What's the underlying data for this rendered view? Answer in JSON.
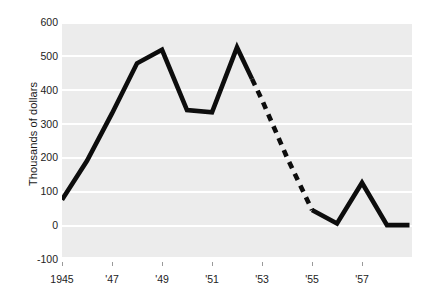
{
  "axes": {
    "ylabel": "Thousands of dollars",
    "yticks": [
      600,
      500,
      400,
      300,
      200,
      100,
      0,
      -100
    ],
    "ytick_labels": [
      "600",
      "500",
      "400",
      "300",
      "200",
      "100",
      "0",
      "-100"
    ],
    "xtick_labels": [
      "1945",
      "'47",
      "'49",
      "'51",
      "'53",
      "'55",
      "'57"
    ],
    "xtick_years": [
      1945,
      1947,
      1949,
      1951,
      1953,
      1955,
      1957
    ]
  },
  "style": {
    "plot_background": "#ececec",
    "gridline_color": "#ffffff",
    "line_color": "#0d0d0d",
    "text_color": "#222222"
  },
  "chart_data": {
    "type": "line",
    "title": "",
    "xlabel": "",
    "ylabel": "Thousands of dollars",
    "xlim": [
      1945,
      1959
    ],
    "ylim": [
      -100,
      600
    ],
    "grid": true,
    "legend": "none",
    "x": [
      1945,
      1946,
      1947,
      1948,
      1949,
      1950,
      1951,
      1952,
      1953,
      1954,
      1955,
      1956,
      1957,
      1958,
      1959
    ],
    "series": [
      {
        "name": "Thousands of dollars",
        "values": [
          75,
          190,
          330,
          478,
          518,
          340,
          333,
          525,
          370,
          200,
          45,
          5,
          125,
          0,
          null
        ],
        "linestyle_segments": [
          {
            "from_x": 1945,
            "to_x": 1952.6,
            "style": "solid"
          },
          {
            "from_x": 1952.6,
            "to_x": 1955.0,
            "style": "dashed"
          },
          {
            "from_x": 1955.0,
            "to_x": 1958.9,
            "style": "solid"
          }
        ]
      }
    ]
  }
}
